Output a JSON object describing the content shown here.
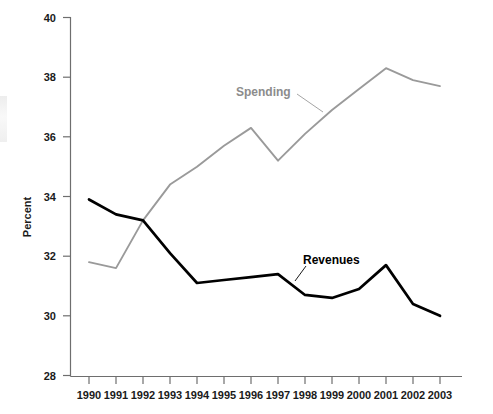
{
  "chart_data": {
    "type": "line",
    "title": "",
    "subtitle": "",
    "xlabel": "",
    "ylabel": "Percent",
    "categories": [
      "1990",
      "1991",
      "1992",
      "1993",
      "1994",
      "1995",
      "1996",
      "1997",
      "1998",
      "1999",
      "2000",
      "2001",
      "2002",
      "2003"
    ],
    "x": [
      1990,
      1991,
      1992,
      1993,
      1994,
      1995,
      1996,
      1997,
      1998,
      1999,
      2000,
      2001,
      2002,
      2003
    ],
    "series": [
      {
        "name": "Spending",
        "color": "#9a9a9a",
        "values": [
          31.8,
          31.6,
          33.2,
          34.4,
          35.0,
          35.7,
          36.3,
          35.2,
          36.1,
          36.9,
          37.6,
          38.3,
          37.9,
          37.7
        ]
      },
      {
        "name": "Revenues",
        "color": "#000000",
        "values": [
          33.9,
          33.4,
          33.2,
          32.1,
          31.1,
          31.2,
          31.3,
          31.4,
          30.7,
          30.6,
          30.9,
          31.7,
          30.4,
          30.0
        ]
      }
    ],
    "ylim": [
      28,
      40
    ],
    "xlim": [
      1990,
      2003
    ],
    "yticks": [
      28,
      30,
      32,
      34,
      36,
      38,
      40
    ],
    "ytick_labels": [
      "28",
      "30",
      "32",
      "34",
      "36",
      "38",
      "40"
    ],
    "grid": false,
    "legend_position": "inline-annotations",
    "annotations": [
      {
        "text": "Spending",
        "series": "Spending",
        "x": 1995,
        "y": 37.5
      },
      {
        "text": "Revenues",
        "series": "Revenues",
        "x": 1999,
        "y": 32.2
      }
    ]
  },
  "axis": {
    "y_title": "Percent"
  }
}
